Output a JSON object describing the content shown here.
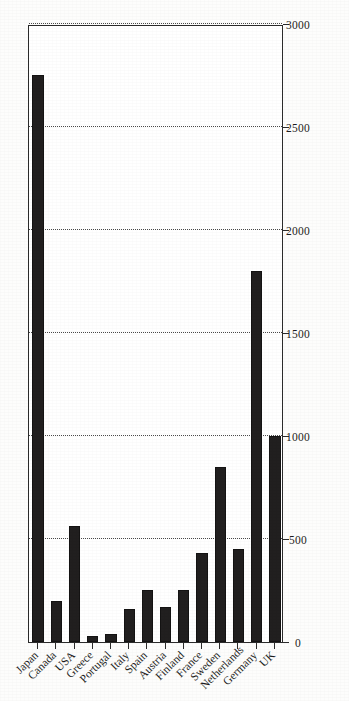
{
  "chart_data": {
    "type": "bar",
    "orientation": "horizontal",
    "title": "",
    "subtitle": "",
    "xlabel": "",
    "ylabel": "",
    "categories": [
      "UK",
      "Germany",
      "Netherlands",
      "Sweden",
      "France",
      "Finland",
      "Austria",
      "Spain",
      "Italy",
      "Portugal",
      "Greece",
      "USA",
      "Canada",
      "Japan"
    ],
    "values": [
      1000,
      1800,
      450,
      850,
      430,
      250,
      170,
      250,
      160,
      40,
      30,
      565,
      200,
      2750
    ],
    "series": [
      {
        "name": "",
        "values": [
          1000,
          1800,
          450,
          850,
          430,
          250,
          170,
          250,
          160,
          40,
          30,
          565,
          200,
          2750
        ]
      }
    ],
    "xlim": [
      0,
      3000
    ],
    "xticks": [
      0,
      500,
      1000,
      1500,
      2000,
      2500,
      3000
    ],
    "xtick_labels": [
      "0",
      "500",
      "1000",
      "1500",
      "2000",
      "2500",
      "3000"
    ],
    "grid": true,
    "grid_axis": "x",
    "grid_style": "dotted",
    "legend": false,
    "legend_position": "none",
    "bar_color": "#211f1f",
    "axis_color": "#2b2b2b",
    "background_color": "#ffffff",
    "annotations": []
  },
  "page": {
    "rotation": "-90deg",
    "appearance": "scanned-document"
  }
}
